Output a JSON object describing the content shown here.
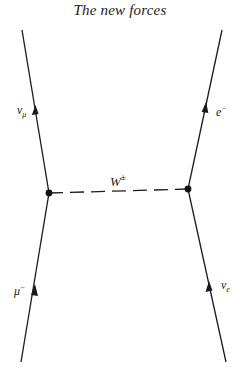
{
  "header": {
    "title": "The new forces"
  },
  "diagram": {
    "type": "feynman",
    "stroke_color": "#1a1a1a",
    "vertices": [
      {
        "id": "left-vertex",
        "x": 49,
        "y": 193
      },
      {
        "id": "right-vertex",
        "x": 188,
        "y": 189
      }
    ],
    "propagator": {
      "label_main": "W",
      "label_sup": "±",
      "style": "dashed"
    },
    "lines": {
      "incoming_left": {
        "particle": "μ",
        "sup": "−",
        "sub": ""
      },
      "outgoing_left": {
        "particle": "ν",
        "sup": "",
        "sub": "μ"
      },
      "outgoing_right": {
        "particle": "e",
        "sup": "−",
        "sub": ""
      },
      "incoming_right": {
        "particle": "ν",
        "sup": "",
        "sub": "e"
      }
    }
  }
}
